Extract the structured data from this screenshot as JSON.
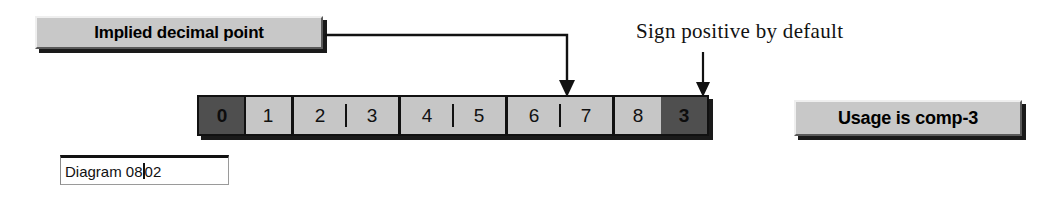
{
  "diagram": {
    "background_color": "#ffffff",
    "ink_color": "#111111",
    "cell_fill_color": "#c6c6c6",
    "cell_highlight_color": "#4f4f4f",
    "callout_fill_color": "#c8c8c8"
  },
  "callouts": {
    "implied_decimal": {
      "label": "Implied decimal point",
      "points_to": "divider between nibble 6 and nibble 7"
    },
    "usage": {
      "label": "Usage is comp-3"
    }
  },
  "annotations": {
    "sign_positive": {
      "text": "Sign positive by default",
      "points_to": "sign nibble"
    }
  },
  "nibble_strip": {
    "groups": [
      {
        "group_name": "byte-1",
        "separator": "hard",
        "nibbles": [
          {
            "digit": "0",
            "highlight": true
          },
          {
            "digit": "1",
            "highlight": false
          }
        ]
      },
      {
        "group_name": "byte-2",
        "separator": "tick",
        "nibbles": [
          {
            "digit": "2",
            "highlight": false
          },
          {
            "digit": "3",
            "highlight": false
          }
        ]
      },
      {
        "group_name": "byte-3",
        "separator": "tick",
        "nibbles": [
          {
            "digit": "4",
            "highlight": false
          },
          {
            "digit": "5",
            "highlight": false
          }
        ]
      },
      {
        "group_name": "byte-4",
        "separator": "tick",
        "nibbles": [
          {
            "digit": "6",
            "highlight": false
          },
          {
            "digit": "7",
            "highlight": false
          }
        ]
      },
      {
        "group_name": "byte-5",
        "separator": "none",
        "nibbles": [
          {
            "digit": "8",
            "highlight": false
          },
          {
            "digit": "3",
            "highlight": true
          }
        ]
      }
    ]
  },
  "caption": {
    "value": "Diagram 08.02",
    "value_before_caret": "Diagram 08",
    "value_after_caret": "02",
    "placeholder": "Diagram"
  }
}
